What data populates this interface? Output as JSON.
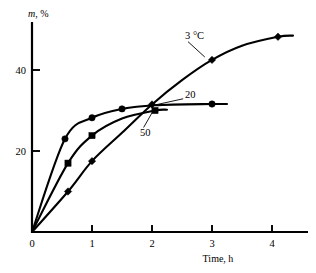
{
  "chart_data": {
    "type": "line",
    "title": "",
    "xlabel": "Time, h",
    "ylabel": "m, %",
    "xlabel_plain": "Time, h",
    "ylabel_italic_part": "m",
    "ylabel_rest": ", %",
    "xlim": [
      0,
      4.7
    ],
    "ylim": [
      0,
      52
    ],
    "xticks": [
      0,
      1,
      2,
      3,
      4
    ],
    "xticklabels": [
      "0",
      "1",
      "2",
      "3",
      "4"
    ],
    "yticks": [
      20,
      40
    ],
    "yticklabels": [
      "20",
      "40"
    ],
    "grid": false,
    "legend": "inline-annotations",
    "annotations": [
      {
        "text": "3 °C",
        "x": 2.55,
        "y": 48.5
      },
      {
        "text": "20",
        "x": 2.55,
        "y": 34.0
      },
      {
        "text": "50",
        "x": 1.8,
        "y": 24.5
      }
    ],
    "series": [
      {
        "name": "20",
        "label": "20",
        "marker": "circle",
        "points": [
          {
            "x": 0.0,
            "y": 0.0
          },
          {
            "x": 0.55,
            "y": 23.0
          },
          {
            "x": 1.0,
            "y": 28.2
          },
          {
            "x": 1.5,
            "y": 30.4
          },
          {
            "x": 2.05,
            "y": 31.3
          },
          {
            "x": 3.0,
            "y": 31.6
          },
          {
            "x": 3.25,
            "y": 31.6
          }
        ],
        "marker_points": [
          {
            "x": 0.55,
            "y": 23.0
          },
          {
            "x": 1.0,
            "y": 28.2
          },
          {
            "x": 1.5,
            "y": 30.4
          },
          {
            "x": 3.0,
            "y": 31.6
          }
        ]
      },
      {
        "name": "50",
        "label": "50",
        "marker": "square",
        "points": [
          {
            "x": 0.0,
            "y": 0.0
          },
          {
            "x": 0.6,
            "y": 17.0
          },
          {
            "x": 1.0,
            "y": 23.8
          },
          {
            "x": 1.5,
            "y": 28.0
          },
          {
            "x": 2.05,
            "y": 30.0
          },
          {
            "x": 2.25,
            "y": 30.2
          }
        ],
        "marker_points": [
          {
            "x": 0.6,
            "y": 17.0
          },
          {
            "x": 1.0,
            "y": 23.8
          },
          {
            "x": 2.05,
            "y": 30.0
          }
        ]
      },
      {
        "name": "3 °C",
        "label": "3 °C",
        "marker": "diamond",
        "points": [
          {
            "x": 0.0,
            "y": 0.0
          },
          {
            "x": 0.6,
            "y": 10.0
          },
          {
            "x": 1.0,
            "y": 17.5
          },
          {
            "x": 1.5,
            "y": 24.5
          },
          {
            "x": 2.0,
            "y": 31.5
          },
          {
            "x": 2.5,
            "y": 37.5
          },
          {
            "x": 3.0,
            "y": 42.5
          },
          {
            "x": 3.5,
            "y": 46.0
          },
          {
            "x": 4.1,
            "y": 48.2
          },
          {
            "x": 4.35,
            "y": 48.5
          }
        ],
        "marker_points": [
          {
            "x": 0.6,
            "y": 10.0
          },
          {
            "x": 1.0,
            "y": 17.5
          },
          {
            "x": 2.0,
            "y": 31.5
          },
          {
            "x": 3.0,
            "y": 42.5
          },
          {
            "x": 4.1,
            "y": 48.2
          }
        ]
      }
    ]
  }
}
